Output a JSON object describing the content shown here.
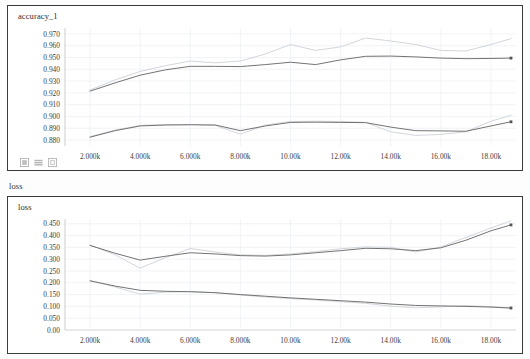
{
  "app": {
    "section_label": "loss"
  },
  "toolbar": {
    "icons": [
      {
        "name": "expand-chart-icon",
        "label": "expand"
      },
      {
        "name": "data-table-icon",
        "label": "data"
      },
      {
        "name": "fit-domain-icon",
        "label": "fit"
      }
    ]
  },
  "charts": [
    {
      "id": "accuracy",
      "title": "accuracy_1",
      "ylabels": [
        "0.970",
        "0.960",
        "0.950",
        "0.940",
        "0.930",
        "0.920",
        "0.910",
        "0.900",
        "0.890",
        "0.880"
      ],
      "xlabels": [
        "2.000k",
        "4.000k",
        "6.000k",
        "8.000k",
        "10.00k",
        "12.00k",
        "14.00k",
        "16.00k",
        "18.00k"
      ]
    },
    {
      "id": "loss",
      "title": "loss",
      "ylabels": [
        "0.450",
        "0.400",
        "0.350",
        "0.300",
        "0.250",
        "0.200",
        "0.150",
        "0.100",
        "0.050",
        "0.00"
      ],
      "xlabels": [
        "2.000k",
        "4.000k",
        "6.000k",
        "8.000k",
        "10.00k",
        "12.00k",
        "14.00k",
        "16.00k",
        "18.00k"
      ]
    }
  ],
  "chart_data": [
    {
      "type": "line",
      "title": "accuracy_1",
      "xlabel": "",
      "ylabel": "",
      "xlim": [
        1000,
        19000
      ],
      "ylim": [
        0.875,
        0.975
      ],
      "xticks": [
        2000,
        4000,
        6000,
        8000,
        10000,
        12000,
        14000,
        16000,
        18000
      ],
      "xticklabels": [
        "2.000k",
        "4.000k",
        "6.000k",
        "8.000k",
        "10.00k",
        "12.00k",
        "14.00k",
        "16.00k",
        "18.00k"
      ],
      "yticks": [
        0.88,
        0.89,
        0.9,
        0.91,
        0.92,
        0.93,
        0.94,
        0.95,
        0.96,
        0.97
      ],
      "yticklabels": [
        "0.880",
        "0.890",
        "0.900",
        "0.910",
        "0.920",
        "0.930",
        "0.940",
        "0.950",
        "0.960",
        "0.970"
      ],
      "grid": true,
      "legend": "none",
      "x": [
        2000,
        3000,
        4000,
        5000,
        6000,
        7000,
        8000,
        9000,
        10000,
        11000,
        12000,
        13000,
        14000,
        15000,
        16000,
        17000,
        18000,
        18800
      ],
      "series": [
        {
          "name": "run-a-smoothed",
          "color": "#6b6b6b",
          "style": "solid",
          "endpoint_marker": true,
          "values": [
            0.9215,
            0.9285,
            0.935,
            0.9395,
            0.9425,
            0.9425,
            0.9423,
            0.944,
            0.946,
            0.944,
            0.948,
            0.951,
            0.9512,
            0.9505,
            0.9495,
            0.949,
            0.9492,
            0.9495
          ]
        },
        {
          "name": "run-a-raw",
          "color": "#c9cfd6",
          "style": "solid",
          "endpoint_marker": false,
          "values": [
            0.9225,
            0.931,
            0.9382,
            0.943,
            0.947,
            0.9455,
            0.947,
            0.953,
            0.961,
            0.956,
            0.959,
            0.9665,
            0.964,
            0.961,
            0.956,
            0.9555,
            0.961,
            0.966
          ]
        },
        {
          "name": "run-b-smoothed",
          "color": "#6b6b6b",
          "style": "solid",
          "endpoint_marker": true,
          "values": [
            0.8825,
            0.888,
            0.892,
            0.8928,
            0.893,
            0.8928,
            0.888,
            0.892,
            0.895,
            0.8952,
            0.895,
            0.8948,
            0.891,
            0.888,
            0.8878,
            0.8875,
            0.892,
            0.8955
          ]
        },
        {
          "name": "run-b-raw",
          "color": "#c9cfd6",
          "style": "solid",
          "endpoint_marker": false,
          "values": [
            0.883,
            0.8885,
            0.8925,
            0.893,
            0.8932,
            0.8925,
            0.885,
            0.8928,
            0.8958,
            0.896,
            0.8958,
            0.895,
            0.887,
            0.884,
            0.8848,
            0.887,
            0.896,
            0.901
          ]
        }
      ]
    },
    {
      "type": "line",
      "title": "loss",
      "xlabel": "",
      "ylabel": "",
      "xlim": [
        1000,
        19000
      ],
      "ylim": [
        0.0,
        0.47
      ],
      "xticks": [
        2000,
        4000,
        6000,
        8000,
        10000,
        12000,
        14000,
        16000,
        18000
      ],
      "xticklabels": [
        "2.000k",
        "4.000k",
        "6.000k",
        "8.000k",
        "10.00k",
        "12.00k",
        "14.00k",
        "16.00k",
        "18.00k"
      ],
      "yticks": [
        0.0,
        0.05,
        0.1,
        0.15,
        0.2,
        0.25,
        0.3,
        0.35,
        0.4,
        0.45
      ],
      "yticklabels": [
        "0.00",
        "0.050",
        "0.100",
        "0.150",
        "0.200",
        "0.250",
        "0.300",
        "0.350",
        "0.400",
        "0.450"
      ],
      "grid": true,
      "legend": "none",
      "x": [
        2000,
        3000,
        4000,
        5000,
        6000,
        7000,
        8000,
        9000,
        10000,
        11000,
        12000,
        13000,
        14000,
        15000,
        16000,
        17000,
        18000,
        18800
      ],
      "series": [
        {
          "name": "run-a-smoothed",
          "color": "#6b6b6b",
          "style": "solid",
          "endpoint_marker": true,
          "values": [
            0.358,
            0.325,
            0.296,
            0.312,
            0.327,
            0.322,
            0.315,
            0.313,
            0.318,
            0.327,
            0.336,
            0.346,
            0.344,
            0.336,
            0.348,
            0.38,
            0.42,
            0.445
          ]
        },
        {
          "name": "run-a-raw",
          "color": "#c9cfd6",
          "style": "solid",
          "endpoint_marker": false,
          "values": [
            0.36,
            0.318,
            0.262,
            0.306,
            0.345,
            0.33,
            0.318,
            0.316,
            0.322,
            0.332,
            0.344,
            0.352,
            0.35,
            0.33,
            0.352,
            0.392,
            0.432,
            0.462
          ]
        },
        {
          "name": "run-b-smoothed",
          "color": "#6b6b6b",
          "style": "solid",
          "endpoint_marker": true,
          "values": [
            0.208,
            0.186,
            0.168,
            0.164,
            0.162,
            0.158,
            0.15,
            0.143,
            0.136,
            0.13,
            0.124,
            0.118,
            0.11,
            0.104,
            0.102,
            0.1,
            0.097,
            0.093
          ]
        },
        {
          "name": "run-b-raw",
          "color": "#c9cfd6",
          "style": "solid",
          "endpoint_marker": false,
          "values": [
            0.21,
            0.182,
            0.152,
            0.16,
            0.163,
            0.158,
            0.148,
            0.14,
            0.133,
            0.127,
            0.12,
            0.113,
            0.101,
            0.094,
            0.098,
            0.103,
            0.099,
            0.092
          ]
        }
      ]
    }
  ]
}
